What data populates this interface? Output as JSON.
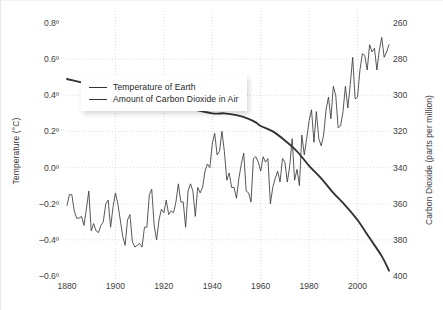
{
  "chart_data": {
    "type": "line",
    "title": "",
    "xlabel": "",
    "ylabel": "Temperature (°C)",
    "y2label": "Carbon Dioxide (parts per million)",
    "grid": true,
    "legend_position": "upper-left-inside",
    "xlim": [
      1880,
      2013
    ],
    "xticks": [
      "1880",
      "1900",
      "1920",
      "1940",
      "1960",
      "1980",
      "2000"
    ],
    "xtick_values": [
      1880,
      1900,
      1920,
      1940,
      1960,
      1980,
      2000
    ],
    "ylim": [
      -0.6,
      0.8
    ],
    "yticks": [
      "0.8º",
      "0.6º",
      "0.4º",
      "0.2º",
      "0.0º",
      "–0.2º",
      "–0.4º",
      "–0.6º"
    ],
    "ytick_values": [
      0.8,
      0.6,
      0.4,
      0.2,
      0.0,
      -0.2,
      -0.4,
      -0.6
    ],
    "y2lim": [
      260,
      400
    ],
    "y2ticks": [
      "400",
      "380",
      "360",
      "340",
      "320",
      "300",
      "280",
      "260"
    ],
    "y2tick_values": [
      400,
      380,
      360,
      340,
      320,
      300,
      280,
      260
    ],
    "colors": {
      "temperature": "#3a3a3a",
      "co2": "#333333",
      "grid": "#cccccc"
    },
    "series": [
      {
        "name": "Temperature of Earth",
        "axis": "left",
        "units": "°C",
        "x": [
          1880,
          1881,
          1882,
          1883,
          1884,
          1885,
          1886,
          1887,
          1888,
          1889,
          1890,
          1891,
          1892,
          1893,
          1894,
          1895,
          1896,
          1897,
          1898,
          1899,
          1900,
          1901,
          1902,
          1903,
          1904,
          1905,
          1906,
          1907,
          1908,
          1909,
          1910,
          1911,
          1912,
          1913,
          1914,
          1915,
          1916,
          1917,
          1918,
          1919,
          1920,
          1921,
          1922,
          1923,
          1924,
          1925,
          1926,
          1927,
          1928,
          1929,
          1930,
          1931,
          1932,
          1933,
          1934,
          1935,
          1936,
          1937,
          1938,
          1939,
          1940,
          1941,
          1942,
          1943,
          1944,
          1945,
          1946,
          1947,
          1948,
          1949,
          1950,
          1951,
          1952,
          1953,
          1954,
          1955,
          1956,
          1957,
          1958,
          1959,
          1960,
          1961,
          1962,
          1963,
          1964,
          1965,
          1966,
          1967,
          1968,
          1969,
          1970,
          1971,
          1972,
          1973,
          1974,
          1975,
          1976,
          1977,
          1978,
          1979,
          1980,
          1981,
          1982,
          1983,
          1984,
          1985,
          1986,
          1987,
          1988,
          1989,
          1990,
          1991,
          1992,
          1993,
          1994,
          1995,
          1996,
          1997,
          1998,
          1999,
          2000,
          2001,
          2002,
          2003,
          2004,
          2005,
          2006,
          2007,
          2008,
          2009,
          2010,
          2011,
          2012,
          2013
        ],
        "values": [
          -0.21,
          -0.15,
          -0.15,
          -0.24,
          -0.28,
          -0.28,
          -0.27,
          -0.32,
          -0.23,
          -0.13,
          -0.35,
          -0.31,
          -0.35,
          -0.36,
          -0.32,
          -0.3,
          -0.2,
          -0.18,
          -0.33,
          -0.22,
          -0.14,
          -0.2,
          -0.29,
          -0.38,
          -0.43,
          -0.29,
          -0.26,
          -0.41,
          -0.44,
          -0.43,
          -0.42,
          -0.44,
          -0.33,
          -0.33,
          -0.15,
          -0.12,
          -0.32,
          -0.4,
          -0.29,
          -0.23,
          -0.25,
          -0.18,
          -0.26,
          -0.24,
          -0.25,
          -0.19,
          -0.09,
          -0.19,
          -0.19,
          -0.33,
          -0.13,
          -0.09,
          -0.13,
          -0.27,
          -0.11,
          -0.14,
          -0.11,
          -0.02,
          0.02,
          0.0,
          0.13,
          0.19,
          0.07,
          0.09,
          0.2,
          0.09,
          -0.07,
          -0.03,
          -0.11,
          -0.11,
          -0.17,
          -0.06,
          0.02,
          0.08,
          -0.13,
          -0.14,
          -0.19,
          0.05,
          0.06,
          0.03,
          -0.02,
          0.06,
          0.03,
          0.05,
          -0.2,
          -0.11,
          -0.06,
          -0.02,
          -0.08,
          0.05,
          0.03,
          -0.08,
          0.01,
          0.16,
          -0.07,
          -0.01,
          -0.1,
          0.18,
          0.07,
          0.16,
          0.26,
          0.32,
          0.14,
          0.31,
          0.16,
          0.12,
          0.18,
          0.32,
          0.39,
          0.27,
          0.45,
          0.4,
          0.22,
          0.23,
          0.31,
          0.45,
          0.33,
          0.46,
          0.61,
          0.38,
          0.39,
          0.54,
          0.63,
          0.62,
          0.54,
          0.68,
          0.64,
          0.66,
          0.54,
          0.65,
          0.72,
          0.61,
          0.64,
          0.68
        ]
      },
      {
        "name": "Amount of Carbon Dioxide in Air",
        "axis": "right",
        "units": "ppm",
        "x": [
          1880,
          1890,
          1900,
          1910,
          1920,
          1930,
          1940,
          1945,
          1950,
          1955,
          1958,
          1960,
          1965,
          1970,
          1975,
          1980,
          1985,
          1990,
          1995,
          2000,
          2005,
          2010,
          2013
        ],
        "values": [
          291,
          294,
          296,
          299,
          303,
          307,
          310,
          310,
          311,
          313,
          315,
          317,
          320,
          325,
          331,
          339,
          346,
          354,
          361,
          369,
          379,
          389,
          397
        ]
      }
    ],
    "annotations": []
  },
  "legend": {
    "items": [
      {
        "label": "Temperature of Earth"
      },
      {
        "label": "Amount of Carbon Dioxide in Air"
      }
    ]
  }
}
